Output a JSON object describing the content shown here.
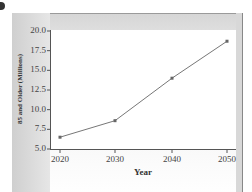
{
  "chart_data": {
    "type": "line",
    "title": "",
    "xlabel": "Year",
    "ylabel": "85 and Older (Millions)",
    "x": [
      2020,
      2030,
      2040,
      2050
    ],
    "series": [
      {
        "name": "85 and Older",
        "values": [
          6.5,
          8.6,
          14.0,
          18.7
        ]
      }
    ],
    "ylim": [
      5.0,
      20.0
    ],
    "yticks": [
      "5.0",
      "7.5",
      "10.0",
      "12.5",
      "15.0",
      "17.5",
      "20.0"
    ],
    "xticks": [
      "2020",
      "2030",
      "2040",
      "2050"
    ],
    "grid": false,
    "legend": null,
    "colors": {
      "line": "#777777",
      "marker": "#666666"
    }
  }
}
